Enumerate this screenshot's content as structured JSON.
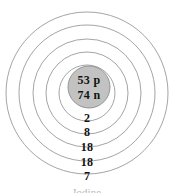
{
  "diagram": {
    "type": "bohr-atomic-model",
    "element_caption": "Iodine",
    "nucleus": {
      "protons_label": "53 p",
      "neutrons_label": "74 n",
      "fill_color": "#c2c2c2",
      "stroke_color": "#8d8d8d"
    },
    "shell_stroke_color": "#9a9a9a",
    "background_color": "#ffffff",
    "text_color": "#121212",
    "shells": [
      {
        "index": 1,
        "electrons": "2"
      },
      {
        "index": 2,
        "electrons": "8"
      },
      {
        "index": 3,
        "electrons": "18"
      },
      {
        "index": 4,
        "electrons": "18"
      },
      {
        "index": 5,
        "electrons": "7"
      }
    ]
  }
}
